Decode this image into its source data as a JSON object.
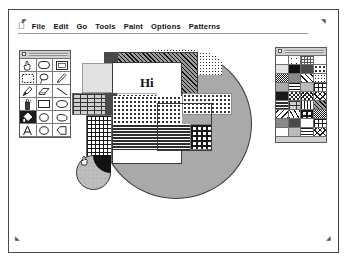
{
  "app": {
    "name": "MacPaint",
    "window_title": ""
  },
  "menubar": {
    "apple_icon": "apple-icon",
    "items": [
      {
        "label": "File",
        "name": "menu-file"
      },
      {
        "label": "Edit",
        "name": "menu-edit"
      },
      {
        "label": "Go",
        "name": "menu-go"
      },
      {
        "label": "Tools",
        "name": "menu-tools"
      },
      {
        "label": "Paint",
        "name": "menu-paint"
      },
      {
        "label": "Options",
        "name": "menu-options"
      },
      {
        "label": "Patterns",
        "name": "menu-patterns"
      }
    ]
  },
  "tool_palette": {
    "title": "",
    "close_box": "close-box",
    "selected_tool": "paint-bucket",
    "tools": [
      {
        "icon": "hand-grabber-icon",
        "label": "Grabber",
        "selected": false
      },
      {
        "icon": "rounded-rect-icon",
        "label": "Rounded Rectangle",
        "selected": false
      },
      {
        "icon": "rectangle-icon",
        "label": "Rectangle",
        "selected": false
      },
      {
        "icon": "marquee-select-icon",
        "label": "Selection Marquee",
        "selected": false
      },
      {
        "icon": "lasso-icon",
        "label": "Lasso",
        "selected": false
      },
      {
        "icon": "pencil-icon",
        "label": "Pencil",
        "selected": false
      },
      {
        "icon": "paintbrush-icon",
        "label": "Paintbrush",
        "selected": false
      },
      {
        "icon": "eraser-icon",
        "label": "Eraser",
        "selected": false
      },
      {
        "icon": "line-icon",
        "label": "Line",
        "selected": false
      },
      {
        "icon": "spray-can-icon",
        "label": "Spray Can",
        "selected": false
      },
      {
        "icon": "hollow-rect-icon",
        "label": "Hollow Rectangle",
        "selected": false
      },
      {
        "icon": "oval-icon",
        "label": "Oval",
        "selected": false
      },
      {
        "icon": "paint-bucket-icon",
        "label": "Paint Bucket",
        "selected": true
      },
      {
        "icon": "circle-icon",
        "label": "Circle",
        "selected": false
      },
      {
        "icon": "freeform-icon",
        "label": "Freeform Shape",
        "selected": false
      },
      {
        "icon": "text-tool-icon",
        "label": "Text",
        "selected": false
      },
      {
        "icon": "ellipse-icon",
        "label": "Ellipse",
        "selected": false
      },
      {
        "icon": "polygon-icon",
        "label": "Polygon",
        "selected": false
      }
    ]
  },
  "patterns_palette": {
    "title": "",
    "close_box": "close-box",
    "swatches": [
      {
        "name": "pattern-white",
        "fill": "p-white"
      },
      {
        "name": "pattern-light-dots",
        "fill": "p-sparse"
      },
      {
        "name": "pattern-fine-grid",
        "fill": "p-gridfine"
      },
      {
        "name": "pattern-gray-25",
        "fill": "p-gray25"
      },
      {
        "name": "pattern-ltgray",
        "fill": "p-ltgray"
      },
      {
        "name": "pattern-black",
        "fill": "p-black"
      },
      {
        "name": "pattern-dkgray",
        "fill": "p-dkgray"
      },
      {
        "name": "pattern-v-dots",
        "fill": "p-vdot"
      },
      {
        "name": "pattern-gray-50",
        "fill": "p-gray50"
      },
      {
        "name": "pattern-midgray",
        "fill": "p-midgray"
      },
      {
        "name": "pattern-diag-right",
        "fill": "p-diagr"
      },
      {
        "name": "pattern-sparse-dot",
        "fill": "p-lightdot"
      },
      {
        "name": "pattern-solid-gray",
        "fill": "p-solidgray"
      },
      {
        "name": "pattern-h-lines",
        "fill": "p-hline"
      },
      {
        "name": "pattern-scale",
        "fill": "p-scale"
      },
      {
        "name": "pattern-grid",
        "fill": "p-grid"
      },
      {
        "name": "pattern-gray-75",
        "fill": "p-gray75"
      },
      {
        "name": "pattern-checker",
        "fill": "p-chk"
      },
      {
        "name": "pattern-weave",
        "fill": "p-weave"
      },
      {
        "name": "pattern-cross",
        "fill": "p-cross"
      },
      {
        "name": "pattern-dense",
        "fill": "p-dense"
      },
      {
        "name": "pattern-brick",
        "fill": "p-brick"
      },
      {
        "name": "pattern-v-lines",
        "fill": "p-vline"
      },
      {
        "name": "pattern-hatch",
        "fill": "p-hatch2"
      },
      {
        "name": "pattern-diag-left",
        "fill": "p-diagl"
      },
      {
        "name": "pattern-zigzag",
        "fill": "p-zig"
      },
      {
        "name": "pattern-waffle",
        "fill": "p-waffle"
      },
      {
        "name": "pattern-gray-50-b",
        "fill": "p-gray50"
      },
      {
        "name": "pattern-midgray-b",
        "fill": "p-midgray"
      },
      {
        "name": "pattern-dkgray-b",
        "fill": "p-dkgray"
      },
      {
        "name": "pattern-white-b",
        "fill": "p-white"
      },
      {
        "name": "pattern-grid-b",
        "fill": "p-grid"
      },
      {
        "name": "pattern-gray-25-b",
        "fill": "p-gray25"
      },
      {
        "name": "pattern-scale-b",
        "fill": "p-scale"
      },
      {
        "name": "pattern-h-lines-b",
        "fill": "p-hline"
      },
      {
        "name": "pattern-cross-b",
        "fill": "p-cross"
      }
    ]
  },
  "canvas": {
    "name": "drawing-canvas",
    "text_objects": [
      {
        "content": "Hi",
        "name": "canvas-text-hi"
      }
    ],
    "shapes": [
      {
        "name": "large-gray-ellipse",
        "fill": "p-solidgray"
      },
      {
        "name": "halftone-dot-ellipse",
        "fill": "p-lightdot"
      },
      {
        "name": "diagonal-hatch-rect",
        "fill": "p-hatch2"
      },
      {
        "name": "dark-corner-square",
        "fill": "p-dkgray"
      },
      {
        "name": "white-text-box",
        "fill": "p-white"
      },
      {
        "name": "brick-band",
        "fill": "p-brick"
      },
      {
        "name": "dotted-band",
        "fill": "p-vdot"
      },
      {
        "name": "striped-band",
        "fill": "p-dense"
      },
      {
        "name": "grid-square",
        "fill": "p-grid"
      },
      {
        "name": "small-scale-circle",
        "fill": "p-scale"
      },
      {
        "name": "black-pie-wedge",
        "fill": "p-black"
      }
    ]
  },
  "colors": {
    "window_border": "#4a4a4a",
    "palette_bg": "#d8d8d8",
    "ink": "#121212",
    "canvas_bg": "#ffffff",
    "gray_fill": "#a9a9a9"
  },
  "marks": {
    "registration": "registration-mark"
  }
}
